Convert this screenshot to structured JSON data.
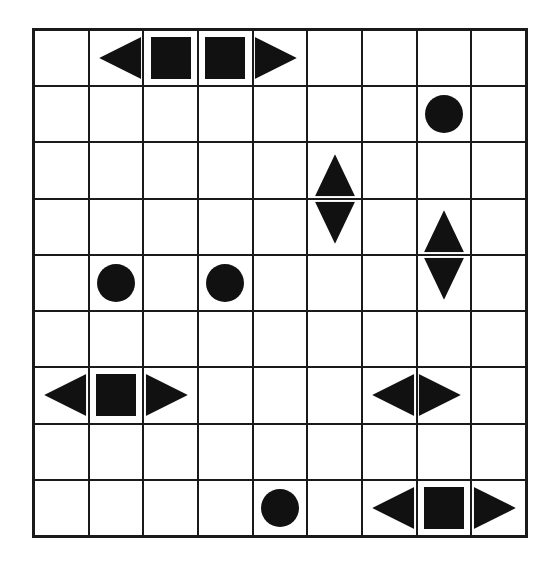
{
  "puzzle": {
    "type": "battleships",
    "rows": 9,
    "cols": 9,
    "color": "#111111",
    "cells": [
      {
        "r": 0,
        "c": 1,
        "shape": "left-end"
      },
      {
        "r": 0,
        "c": 2,
        "shape": "square"
      },
      {
        "r": 0,
        "c": 3,
        "shape": "square"
      },
      {
        "r": 0,
        "c": 4,
        "shape": "right-end"
      },
      {
        "r": 1,
        "c": 7,
        "shape": "circle"
      },
      {
        "r": 2,
        "c": 5,
        "shape": "top-end"
      },
      {
        "r": 3,
        "c": 5,
        "shape": "bottom-end"
      },
      {
        "r": 3,
        "c": 7,
        "shape": "top-end"
      },
      {
        "r": 4,
        "c": 1,
        "shape": "circle"
      },
      {
        "r": 4,
        "c": 3,
        "shape": "circle"
      },
      {
        "r": 4,
        "c": 7,
        "shape": "bottom-end"
      },
      {
        "r": 6,
        "c": 0,
        "shape": "left-end"
      },
      {
        "r": 6,
        "c": 1,
        "shape": "square"
      },
      {
        "r": 6,
        "c": 2,
        "shape": "right-end"
      },
      {
        "r": 6,
        "c": 6,
        "shape": "left-end"
      },
      {
        "r": 6,
        "c": 7,
        "shape": "right-end"
      },
      {
        "r": 8,
        "c": 4,
        "shape": "circle"
      },
      {
        "r": 8,
        "c": 6,
        "shape": "left-end"
      },
      {
        "r": 8,
        "c": 7,
        "shape": "square"
      },
      {
        "r": 8,
        "c": 8,
        "shape": "right-end"
      }
    ]
  }
}
